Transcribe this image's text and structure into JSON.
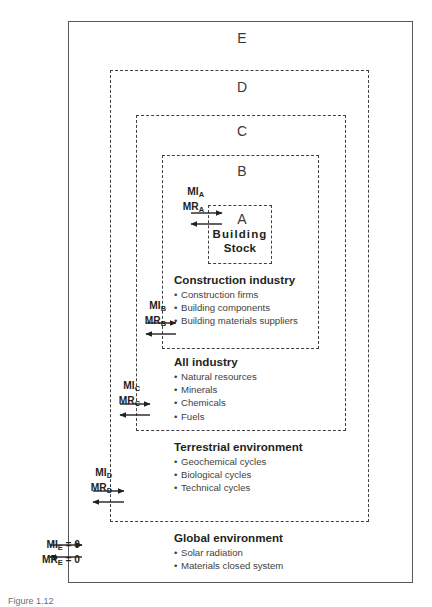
{
  "figure": {
    "caption": "Figure 1.12"
  },
  "zones": {
    "e": {
      "letter": "E"
    },
    "d": {
      "letter": "D"
    },
    "c": {
      "letter": "C"
    },
    "b": {
      "letter": "B"
    },
    "a": {
      "letter": "A"
    }
  },
  "stock": {
    "line1": "Building",
    "line2": "Stock"
  },
  "groups": {
    "construction": {
      "title": "Construction industry",
      "items": [
        "Construction firms",
        "Building components",
        "Building materials suppliers"
      ]
    },
    "all_industry": {
      "title": "All industry",
      "items": [
        "Natural resources",
        "Minerals",
        "Chemicals",
        "Fuels"
      ]
    },
    "terrestrial": {
      "title": "Terrestrial environment",
      "items": [
        "Geochemical cycles",
        "Biological cycles",
        "Technical cycles"
      ]
    },
    "global": {
      "title": "Global environment",
      "items": [
        "Solar radiation",
        "Materials closed system"
      ]
    }
  },
  "flows": {
    "a": {
      "input": "MI",
      "input_sub": "A",
      "output": "MR",
      "output_sub": "A",
      "input_value": "",
      "output_value": ""
    },
    "b": {
      "input": "MI",
      "input_sub": "B",
      "output": "MR",
      "output_sub": "B",
      "input_value": "",
      "output_value": ""
    },
    "c": {
      "input": "MI",
      "input_sub": "C",
      "output": "MR",
      "output_sub": "C",
      "input_value": "",
      "output_value": ""
    },
    "d": {
      "input": "MI",
      "input_sub": "D",
      "output": "MR",
      "output_sub": "D",
      "input_value": "",
      "output_value": ""
    },
    "e": {
      "input": "MI",
      "input_sub": "E",
      "output": "MR",
      "output_sub": "E",
      "input_value": " = 0",
      "output_value": " = 0"
    }
  },
  "colors": {
    "solid_border": "#58585b",
    "dashed_border": "#404042",
    "text": "#231f20",
    "bullet_text": "#3f3f41"
  }
}
